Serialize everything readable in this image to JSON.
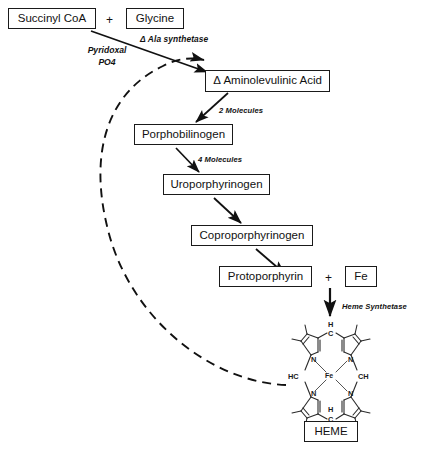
{
  "diagram": {
    "accent_color": "#111111",
    "background_color": "#ffffff"
  },
  "nodes": {
    "succinyl_coa": "Succinyl CoA",
    "glycine": "Glycine",
    "ala": "Δ Aminolevulinic Acid",
    "porphobilinogen": "Porphobilinogen",
    "uroporphyrinogen": "Uroporphyrinogen",
    "coproporphyrinogen": "Coproporphyrinogen",
    "protoporphyrin": "Protoporphyrin",
    "fe": "Fe",
    "heme": "HEME"
  },
  "operators": {
    "plus_top": "+",
    "plus_bottom": "+"
  },
  "labels": {
    "ala_synthetase": "Δ Ala synthetase",
    "pyridoxal": "Pyridoxal",
    "po4": "PO4",
    "two_molecules": "2 Molecules",
    "four_molecules": "4 Molecules",
    "heme_synthetase": "Heme Synthetase"
  },
  "structure": {
    "name": "porphyrin-ring",
    "center_atom": "Fe",
    "nitrogen_label": "N",
    "meso_top_h": "H",
    "meso_top_c": "C",
    "meso_bottom_c": "C",
    "meso_bottom_h": "H",
    "meso_left": "HC",
    "meso_right": "CH"
  }
}
